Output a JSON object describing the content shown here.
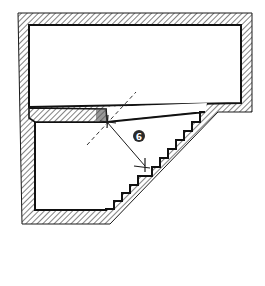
{
  "diagram": {
    "type": "architectural-floor-plan",
    "callout": {
      "label": "6"
    },
    "colors": {
      "ink": "#1a1a1a",
      "background": "#ffffff",
      "callout_fill": "#2a2a2a",
      "callout_text": "#ffffff"
    },
    "elements": [
      {
        "name": "outer-wall",
        "style": "hatched"
      },
      {
        "name": "upper-room",
        "style": "open-space"
      },
      {
        "name": "lower-room",
        "style": "open-space"
      },
      {
        "name": "interior-wall-stub",
        "style": "hatched"
      },
      {
        "name": "stepped-diagonal-wall",
        "style": "hatched-stairs"
      },
      {
        "name": "dashed-guide-line",
        "style": "dashed"
      },
      {
        "name": "dimension-line",
        "style": "arrow-with-ticks"
      }
    ]
  }
}
